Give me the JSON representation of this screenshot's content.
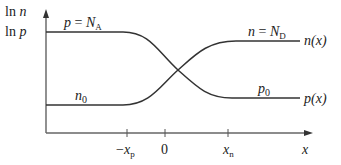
{
  "figure": {
    "y_axis_label_line1": "ln n",
    "y_axis_label_line2": "ln p",
    "x_axis_label": "x",
    "ticks": [
      {
        "label": "−x_p",
        "main": "−x",
        "sub": "p"
      },
      {
        "label": "0",
        "main": "0",
        "sub": ""
      },
      {
        "label": "x_n",
        "main": "x",
        "sub": "n"
      }
    ],
    "curves": {
      "p": {
        "left_level_label": "p = N_A",
        "left_main": "p = N",
        "left_sub": "A",
        "right_level_label": "p_0",
        "right_main": "p",
        "right_sub": "0",
        "end_label": "p(x)"
      },
      "n": {
        "left_level_label": "n_0",
        "left_main": "n",
        "left_sub": "0",
        "right_level_label": "n = N_D",
        "right_main": "n = N",
        "right_sub": "D",
        "end_label": "n(x)"
      }
    },
    "colors": {
      "axis": "#555555",
      "curve": "#333333",
      "text": "#222222"
    }
  }
}
